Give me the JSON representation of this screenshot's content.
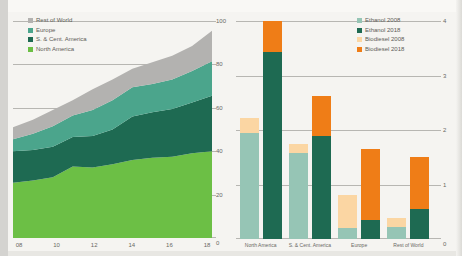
{
  "page": {
    "background": "#f5f4f1"
  },
  "colors": {
    "north_america": "#6cbf45",
    "s_cent_america": "#1e6a52",
    "europe": "#4ba58c",
    "rest_of_world": "#b3b2b0",
    "ethanol_2008": "#96c5b5",
    "ethanol_2018": "#1e6a52",
    "biodiesel_2008": "#fbd6a3",
    "biodiesel_2018": "#ef7d17",
    "gridline": "#b7b6b2",
    "text": "#6a6964"
  },
  "left_chart": {
    "legend": [
      {
        "label": "Rest of World",
        "color_key": "rest_of_world"
      },
      {
        "label": "Europe",
        "color_key": "europe"
      },
      {
        "label": "S. & Cent. America",
        "color_key": "s_cent_america"
      },
      {
        "label": "North America",
        "color_key": "north_america"
      }
    ]
  },
  "right_chart": {
    "legend": [
      {
        "label": "Ethanol 2008",
        "color_key": "ethanol_2008"
      },
      {
        "label": "Ethanol 2018",
        "color_key": "ethanol_2018"
      },
      {
        "label": "Biodiesel 2008",
        "color_key": "biodiesel_2008"
      },
      {
        "label": "Biodiesel 2018",
        "color_key": "biodiesel_2018"
      }
    ]
  },
  "chart_data": [
    {
      "type": "area",
      "stacked": true,
      "x": [
        "08",
        "09",
        "10",
        "11",
        "12",
        "13",
        "14",
        "15",
        "16",
        "17",
        "18"
      ],
      "x_tick_labels": [
        "08",
        "10",
        "12",
        "14",
        "16",
        "18"
      ],
      "ylim": [
        0,
        100
      ],
      "y_ticks": [
        100,
        80,
        60,
        40,
        20,
        0
      ],
      "y_axis_side": "right",
      "legend_position": "top-left",
      "grid": true,
      "series": [
        {
          "name": "North America",
          "color_key": "north_america",
          "values": [
            25.5,
            26.5,
            28.0,
            33.0,
            32.5,
            34.0,
            36.0,
            37.0,
            37.5,
            39.0,
            40.0
          ]
        },
        {
          "name": "S. & Cent. America",
          "color_key": "s_cent_america",
          "values": [
            14.5,
            14.0,
            14.0,
            13.5,
            14.5,
            16.0,
            20.0,
            21.0,
            22.0,
            23.5,
            25.5
          ]
        },
        {
          "name": "Europe",
          "color_key": "europe",
          "values": [
            5.5,
            7.5,
            9.5,
            10.0,
            12.0,
            13.5,
            13.5,
            13.0,
            13.5,
            14.5,
            16.0
          ]
        },
        {
          "name": "Rest of World",
          "color_key": "rest_of_world",
          "values": [
            5.5,
            6.5,
            7.5,
            7.0,
            9.5,
            9.5,
            8.5,
            10.0,
            11.0,
            11.5,
            14.0
          ]
        }
      ]
    },
    {
      "type": "bar",
      "stacked": true,
      "categories": [
        "North America",
        "S. & Cent. America",
        "Europe",
        "Rest of World"
      ],
      "ylim": [
        0,
        4
      ],
      "y_ticks": [
        4,
        3,
        2,
        1,
        0
      ],
      "y_axis_side": "right",
      "legend_position": "top-right",
      "grid": true,
      "bars_per_category": [
        {
          "year": "2008",
          "segments": [
            "ethanol_2008",
            "biodiesel_2008"
          ]
        },
        {
          "year": "2018",
          "segments": [
            "ethanol_2018",
            "biodiesel_2018"
          ]
        }
      ],
      "series": [
        {
          "name": "Ethanol 2008",
          "color_key": "ethanol_2008",
          "values": [
            1.95,
            1.58,
            0.2,
            0.22
          ]
        },
        {
          "name": "Ethanol 2018",
          "color_key": "ethanol_2018",
          "values": [
            3.43,
            1.9,
            0.35,
            0.55
          ]
        },
        {
          "name": "Biodiesel 2008",
          "color_key": "biodiesel_2008",
          "values": [
            0.27,
            0.17,
            0.61,
            0.17
          ]
        },
        {
          "name": "Biodiesel 2018",
          "color_key": "biodiesel_2018",
          "values": [
            0.57,
            0.72,
            1.3,
            0.95
          ]
        }
      ]
    }
  ]
}
